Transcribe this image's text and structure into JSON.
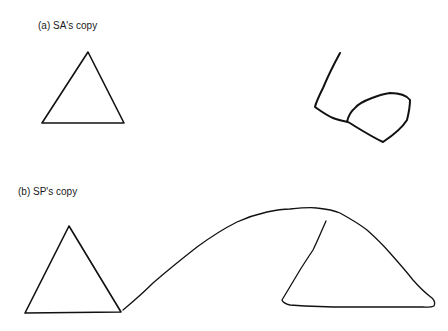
{
  "panels": [
    {
      "id": "a",
      "label": "(a) SA's copy",
      "model_shape": "triangle",
      "copy_shape": "distorted copy (angled line with attached closed loop)"
    },
    {
      "id": "b",
      "label": "(b) SP's copy",
      "model_shape": "triangle",
      "copy_shape": "triangle connected by long arc to second open triangle"
    }
  ],
  "colors": {
    "background": "#ffffff",
    "stroke": "#111111",
    "text": "#1a1a1a"
  }
}
